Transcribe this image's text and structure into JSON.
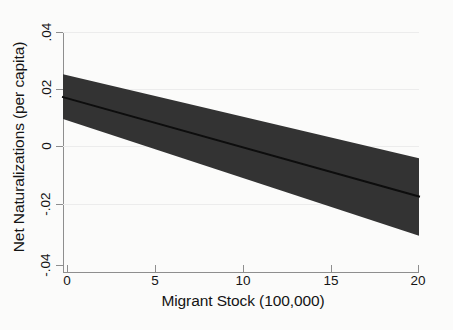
{
  "chart_data": {
    "type": "area",
    "title": "",
    "subtitle": "",
    "xlabel": "Migrant Stock (100,000)",
    "ylabel": "Net Naturalizations (per capita)",
    "xlim": [
      0,
      20
    ],
    "ylim": [
      -0.04,
      0.04
    ],
    "xticks": [
      0,
      5,
      10,
      15,
      20
    ],
    "xtick_labels": [
      "0",
      "5",
      "10",
      "15",
      "20"
    ],
    "yticks": [
      0.04,
      0.02,
      0,
      -0.02,
      -0.04
    ],
    "ytick_labels": [
      ".04",
      ".02",
      "0",
      "-.02",
      "-.04"
    ],
    "grid": "horizontal",
    "legend": "none",
    "series": [
      {
        "name": "Predicted net naturalizations (fitted line)",
        "kind": "line",
        "x": [
          0,
          20
        ],
        "values": [
          0.0183,
          -0.0148
        ]
      },
      {
        "name": "95% confidence interval (upper bound)",
        "kind": "band-upper",
        "x": [
          0,
          20
        ],
        "values": [
          0.0259,
          -0.0021
        ]
      },
      {
        "name": "95% confidence interval (lower bound)",
        "kind": "band-lower",
        "x": [
          0,
          20
        ],
        "values": [
          0.011,
          -0.0279
        ]
      }
    ],
    "crossing_point": {
      "x": 7.8,
      "y": 0.0054
    },
    "zero_crossing_x": 11.1,
    "colors": {
      "band": "#333333",
      "line": "#0d0d0d",
      "axis": "#8e8e8e",
      "grid": "#ececec",
      "text": "#141414",
      "background": "#fbfbfa"
    }
  }
}
